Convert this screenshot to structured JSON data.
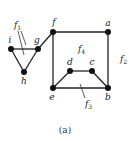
{
  "diagram": {
    "type": "planar-graph",
    "caption": "(a)",
    "vertices": [
      {
        "id": "a",
        "label": "a",
        "x": 108,
        "y": 32,
        "lx": 108,
        "ly": 26
      },
      {
        "id": "b",
        "label": "b",
        "x": 108,
        "y": 88,
        "lx": 108,
        "ly": 100
      },
      {
        "id": "c",
        "label": "c",
        "x": 92,
        "y": 71,
        "lx": 92,
        "ly": 65
      },
      {
        "id": "d",
        "label": "d",
        "x": 70,
        "y": 71,
        "lx": 70,
        "ly": 65
      },
      {
        "id": "e",
        "label": "e",
        "x": 53,
        "y": 88,
        "lx": 52,
        "ly": 100
      },
      {
        "id": "f",
        "label": "f",
        "x": 53,
        "y": 32,
        "lx": 54,
        "ly": 25
      },
      {
        "id": "g",
        "label": "g",
        "x": 38,
        "y": 49,
        "lx": 37,
        "ly": 43
      },
      {
        "id": "h",
        "label": "h",
        "x": 24,
        "y": 72,
        "lx": 24,
        "ly": 84
      },
      {
        "id": "i",
        "label": "i",
        "x": 11,
        "y": 49,
        "lx": 10,
        "ly": 43
      }
    ],
    "edges": [
      [
        "i",
        "g"
      ],
      [
        "i",
        "h"
      ],
      [
        "g",
        "h"
      ],
      [
        "g",
        "f"
      ],
      [
        "f",
        "a"
      ],
      [
        "a",
        "b"
      ],
      [
        "b",
        "e"
      ],
      [
        "e",
        "f"
      ],
      [
        "e",
        "d"
      ],
      [
        "d",
        "c"
      ],
      [
        "c",
        "b"
      ]
    ],
    "faces": [
      {
        "id": "f1",
        "label": "f",
        "sub": "1",
        "x": 14,
        "y": 28
      },
      {
        "id": "f2",
        "label": "f",
        "sub": "2",
        "x": 120,
        "y": 62
      },
      {
        "id": "f3",
        "label": "f",
        "sub": "3",
        "x": 85,
        "y": 107
      },
      {
        "id": "f4",
        "label": "f",
        "sub": "4",
        "x": 78,
        "y": 52
      }
    ],
    "face_pointers": [
      {
        "face": "f1",
        "x1": 18,
        "y1": 31,
        "x2": 24,
        "y2": 55
      },
      {
        "face": "f1",
        "x1": 21,
        "y1": 31,
        "x2": 26,
        "y2": 45
      },
      {
        "face": "f3",
        "x1": 85,
        "y1": 98,
        "x2": 80,
        "y2": 84
      }
    ]
  }
}
